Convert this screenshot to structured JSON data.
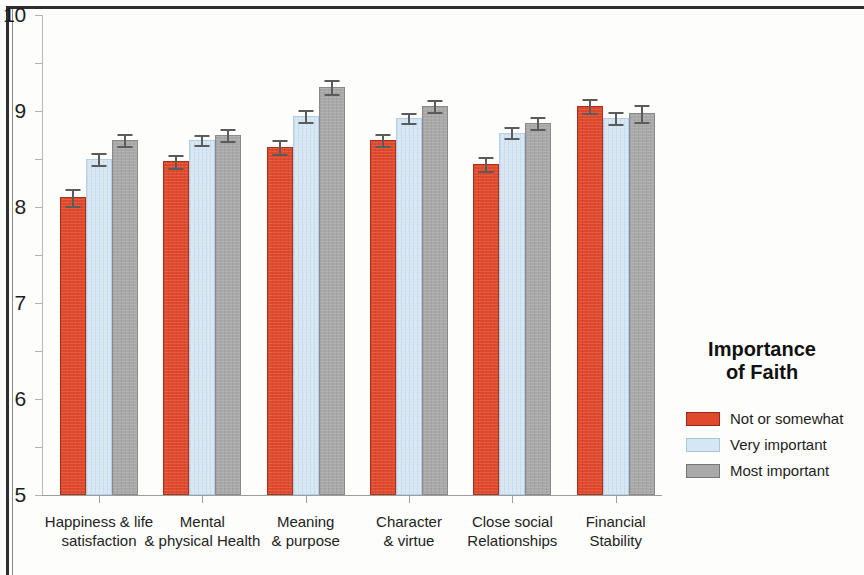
{
  "chart_data": {
    "type": "bar",
    "title": "",
    "xlabel": "",
    "ylabel": "",
    "ylim": [
      0,
      10
    ],
    "ytick_labels": [
      "10",
      "9",
      "8",
      "7",
      "6",
      "5",
      "4",
      "3",
      "2",
      "1",
      "0"
    ],
    "ytick_values": [
      10,
      9,
      8,
      7,
      6,
      5,
      4,
      3,
      2,
      1,
      0
    ],
    "grid": false,
    "legend_position": "right",
    "categories": [
      "Happiness & life\nsatisfaction",
      "Mental\n& physical Health",
      "Meaning\n& purpose",
      "Character\n& virtue",
      "Close social\nRelationships",
      "Financial\nStability"
    ],
    "category_lines": [
      [
        "Happiness & life",
        "satisfaction"
      ],
      [
        "Mental",
        "& physical Health"
      ],
      [
        "Meaning",
        "& purpose"
      ],
      [
        "Character",
        "& virtue"
      ],
      [
        "Close social",
        "Relationships"
      ],
      [
        "Financial",
        "Stability"
      ]
    ],
    "series": [
      {
        "name": "Not or somewhat",
        "color": "#e0492c",
        "values": [
          6.2,
          6.95,
          7.25,
          7.4,
          6.9,
          8.1
        ],
        "errors": [
          0.17,
          0.13,
          0.14,
          0.13,
          0.15,
          0.15
        ]
      },
      {
        "name": "Very important",
        "color": "#d5e6f4",
        "values": [
          7.0,
          7.4,
          7.9,
          7.85,
          7.55,
          7.85
        ],
        "errors": [
          0.12,
          0.11,
          0.12,
          0.1,
          0.12,
          0.13
        ]
      },
      {
        "name": "Most important",
        "color": "#a9a9a9",
        "values": [
          7.4,
          7.5,
          8.5,
          8.1,
          7.75,
          7.95
        ],
        "errors": [
          0.13,
          0.12,
          0.15,
          0.12,
          0.13,
          0.18
        ]
      }
    ]
  },
  "legend": {
    "title_line_1": "Importance",
    "title_line_2": "of Faith",
    "entries": [
      {
        "label": "Not or somewhat"
      },
      {
        "label": "Very important"
      },
      {
        "label": "Most important"
      }
    ]
  }
}
